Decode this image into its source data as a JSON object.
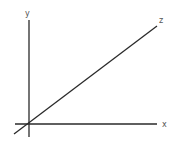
{
  "diagram": {
    "stroke_color": "#2a2a2a",
    "label_color": "#555555",
    "axes": {
      "x": {
        "label": "x",
        "from": [
          15,
          124
        ],
        "to": [
          157,
          124
        ],
        "label_pos": [
          162,
          127
        ]
      },
      "y": {
        "label": "y",
        "from": [
          29,
          20
        ],
        "to": [
          29,
          137
        ],
        "label_pos": [
          25,
          15
        ]
      },
      "z": {
        "label": "z",
        "from": [
          14,
          134
        ],
        "to": [
          157,
          26
        ],
        "label_pos": [
          159,
          23
        ]
      }
    }
  }
}
